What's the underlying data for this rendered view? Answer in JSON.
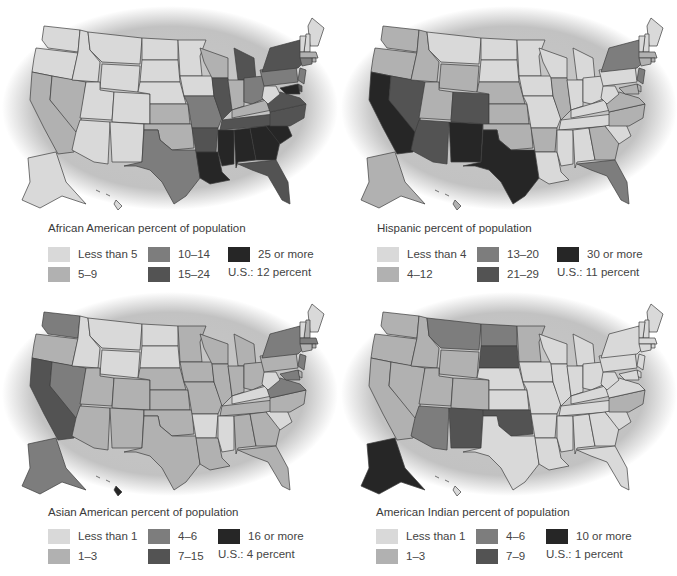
{
  "colors": {
    "c0": "#d9d9d9",
    "c1": "#b1b1b1",
    "c2": "#7d7d7d",
    "c3": "#535353",
    "c4": "#262626",
    "ellipse": "#c4c4c4"
  },
  "maps": [
    {
      "id": "african-american",
      "title": "African American percent of population",
      "legend": [
        "Less than 5",
        "5–9",
        "10–14",
        "15–24",
        "25 or more"
      ],
      "us_note": "U.S.: 12 percent",
      "chart_states": {
        "WA": 0,
        "OR": 0,
        "CA": 1,
        "NV": 1,
        "ID": 0,
        "MT": 0,
        "WY": 0,
        "UT": 0,
        "CO": 0,
        "AZ": 0,
        "NM": 0,
        "ND": 0,
        "SD": 0,
        "NE": 0,
        "KS": 1,
        "OK": 1,
        "TX": 2,
        "MN": 0,
        "IA": 0,
        "MO": 2,
        "AR": 3,
        "LA": 4,
        "WI": 1,
        "IL": 3,
        "MI": 3,
        "IN": 1,
        "OH": 2,
        "KY": 1,
        "TN": 3,
        "MS": 4,
        "AL": 4,
        "GA": 4,
        "FL": 3,
        "SC": 4,
        "NC": 3,
        "VA": 3,
        "WV": 0,
        "PA": 2,
        "NY": 3,
        "ME": 0,
        "NH": 0,
        "VT": 0,
        "MA": 1,
        "RI": 1,
        "CT": 2,
        "NJ": 2,
        "DE": 3,
        "MD": 4,
        "AK": 0,
        "HI": 0
      }
    },
    {
      "id": "hispanic",
      "title": "Hispanic percent of population",
      "legend": [
        "Less than 4",
        "4–12",
        "13–20",
        "21–29",
        "30 or more"
      ],
      "us_note": "U.S.: 11 percent",
      "chart_states": {
        "WA": 1,
        "OR": 1,
        "CA": 4,
        "NV": 3,
        "ID": 1,
        "MT": 0,
        "WY": 1,
        "UT": 1,
        "CO": 3,
        "AZ": 3,
        "NM": 4,
        "ND": 0,
        "SD": 0,
        "NE": 1,
        "KS": 1,
        "OK": 1,
        "TX": 4,
        "MN": 0,
        "IA": 0,
        "MO": 0,
        "AR": 1,
        "LA": 0,
        "WI": 0,
        "IL": 1,
        "MI": 0,
        "IN": 0,
        "OH": 0,
        "KY": 0,
        "TN": 0,
        "MS": 0,
        "AL": 0,
        "GA": 1,
        "FL": 2,
        "SC": 0,
        "NC": 1,
        "VA": 1,
        "WV": 0,
        "PA": 0,
        "NY": 2,
        "ME": 0,
        "NH": 0,
        "VT": 0,
        "MA": 1,
        "RI": 1,
        "CT": 1,
        "NJ": 2,
        "DE": 1,
        "MD": 1,
        "AK": 1,
        "HI": 1
      }
    },
    {
      "id": "asian-american",
      "title": "Asian American percent of population",
      "legend": [
        "Less than 1",
        "1–3",
        "4–6",
        "7–15",
        "16 or more"
      ],
      "us_note": "U.S.: 4 percent",
      "chart_states": {
        "WA": 2,
        "OR": 1,
        "CA": 3,
        "NV": 2,
        "ID": 0,
        "MT": 0,
        "WY": 0,
        "UT": 1,
        "CO": 1,
        "AZ": 1,
        "NM": 1,
        "ND": 0,
        "SD": 0,
        "NE": 1,
        "KS": 1,
        "OK": 1,
        "TX": 1,
        "MN": 1,
        "IA": 1,
        "MO": 1,
        "AR": 0,
        "LA": 1,
        "WI": 1,
        "IL": 1,
        "MI": 1,
        "IN": 1,
        "OH": 1,
        "KY": 0,
        "TN": 1,
        "MS": 0,
        "AL": 1,
        "GA": 1,
        "FL": 1,
        "SC": 0,
        "NC": 1,
        "VA": 2,
        "WV": 0,
        "PA": 1,
        "NY": 2,
        "ME": 0,
        "NH": 1,
        "VT": 0,
        "MA": 2,
        "RI": 1,
        "CT": 1,
        "NJ": 2,
        "DE": 1,
        "MD": 2,
        "AK": 2,
        "HI": 4
      }
    },
    {
      "id": "american-indian",
      "title": "American Indian percent of population",
      "legend": [
        "Less than 1",
        "1–3",
        "4–6",
        "7–9",
        "10 or more"
      ],
      "us_note": "U.S.: 1 percent",
      "chart_states": {
        "WA": 1,
        "OR": 1,
        "CA": 1,
        "NV": 1,
        "ID": 1,
        "MT": 2,
        "WY": 1,
        "UT": 1,
        "CO": 1,
        "AZ": 2,
        "NM": 3,
        "ND": 2,
        "SD": 3,
        "NE": 0,
        "KS": 0,
        "OK": 3,
        "TX": 0,
        "MN": 1,
        "IA": 0,
        "MO": 0,
        "AR": 0,
        "LA": 0,
        "WI": 0,
        "IL": 0,
        "MI": 0,
        "IN": 0,
        "OH": 0,
        "KY": 0,
        "TN": 0,
        "MS": 0,
        "AL": 0,
        "GA": 0,
        "FL": 0,
        "SC": 0,
        "NC": 1,
        "VA": 0,
        "WV": 0,
        "PA": 0,
        "NY": 0,
        "ME": 0,
        "NH": 0,
        "VT": 0,
        "MA": 0,
        "RI": 0,
        "CT": 0,
        "NJ": 0,
        "DE": 0,
        "MD": 0,
        "AK": 4,
        "HI": 0
      }
    }
  ]
}
